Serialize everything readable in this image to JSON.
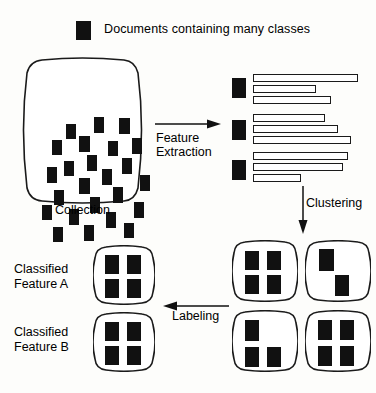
{
  "diagram": {
    "title_text": "Document clustering and classification pipeline",
    "legend": {
      "swatch_name": "document-swatch",
      "label": "Documents containing many classes",
      "swatch_color": "#111111"
    },
    "collection": {
      "caption": "Collection",
      "document_count": 24,
      "documents": [
        {
          "x": 48,
          "y": 67,
          "w": 10,
          "h": 15
        },
        {
          "x": 76,
          "y": 60,
          "w": 10,
          "h": 16
        },
        {
          "x": 101,
          "y": 61,
          "w": 11,
          "h": 16
        },
        {
          "x": 34,
          "y": 83,
          "w": 10,
          "h": 15
        },
        {
          "x": 61,
          "y": 79,
          "w": 11,
          "h": 16
        },
        {
          "x": 90,
          "y": 84,
          "w": 10,
          "h": 15
        },
        {
          "x": 114,
          "y": 81,
          "w": 10,
          "h": 16
        },
        {
          "x": 69,
          "y": 98,
          "w": 10,
          "h": 16
        },
        {
          "x": 46,
          "y": 104,
          "w": 10,
          "h": 15
        },
        {
          "x": 29,
          "y": 110,
          "w": 10,
          "h": 16
        },
        {
          "x": 104,
          "y": 101,
          "w": 10,
          "h": 16
        },
        {
          "x": 84,
          "y": 112,
          "w": 10,
          "h": 16
        },
        {
          "x": 61,
          "y": 121,
          "w": 11,
          "h": 16
        },
        {
          "x": 122,
          "y": 118,
          "w": 10,
          "h": 16
        },
        {
          "x": 36,
          "y": 133,
          "w": 10,
          "h": 15
        },
        {
          "x": 95,
          "y": 130,
          "w": 10,
          "h": 16
        },
        {
          "x": 72,
          "y": 140,
          "w": 10,
          "h": 16
        },
        {
          "x": 24,
          "y": 148,
          "w": 10,
          "h": 15
        },
        {
          "x": 51,
          "y": 152,
          "w": 10,
          "h": 16
        },
        {
          "x": 116,
          "y": 145,
          "w": 10,
          "h": 16
        },
        {
          "x": 88,
          "y": 155,
          "w": 10,
          "h": 16
        },
        {
          "x": 35,
          "y": 170,
          "w": 10,
          "h": 15
        },
        {
          "x": 66,
          "y": 168,
          "w": 10,
          "h": 16
        },
        {
          "x": 106,
          "y": 166,
          "w": 10,
          "h": 15
        }
      ]
    },
    "arrows": {
      "feature_extraction": {
        "label_line1": "Feature",
        "label_line2": "Extraction",
        "direction": "right"
      },
      "clustering": {
        "label": "Clustering",
        "direction": "down"
      },
      "labeling": {
        "label": "Labeling",
        "direction": "left"
      }
    },
    "feature_bars": {
      "groups": [
        {
          "doc_y": 78,
          "bars": [
            {
              "y": 74,
              "w": 105
            },
            {
              "y": 85,
              "w": 63
            },
            {
              "y": 96,
              "w": 78
            }
          ]
        },
        {
          "doc_y": 120,
          "bars": [
            {
              "y": 114,
              "w": 72
            },
            {
              "y": 125,
              "w": 85
            },
            {
              "y": 136,
              "w": 98
            }
          ]
        },
        {
          "doc_y": 160,
          "bars": [
            {
              "y": 152,
              "w": 95
            },
            {
              "y": 163,
              "w": 90
            },
            {
              "y": 174,
              "w": 48
            }
          ]
        }
      ]
    },
    "clusters": [
      {
        "name": "cluster-top-left",
        "x": 232,
        "y": 240,
        "w": 66,
        "h": 62,
        "docs": [
          {
            "x": 13,
            "y": 11,
            "w": 14,
            "h": 19
          },
          {
            "x": 35,
            "y": 11,
            "w": 14,
            "h": 19
          },
          {
            "x": 13,
            "y": 35,
            "w": 14,
            "h": 19
          },
          {
            "x": 35,
            "y": 35,
            "w": 14,
            "h": 19
          }
        ]
      },
      {
        "name": "cluster-top-right",
        "x": 305,
        "y": 240,
        "w": 66,
        "h": 62,
        "docs": [
          {
            "x": 14,
            "y": 9,
            "w": 15,
            "h": 22
          },
          {
            "x": 30,
            "y": 35,
            "w": 14,
            "h": 21
          }
        ]
      },
      {
        "name": "cluster-bottom-left",
        "x": 232,
        "y": 310,
        "w": 66,
        "h": 62,
        "docs": [
          {
            "x": 13,
            "y": 10,
            "w": 14,
            "h": 21
          },
          {
            "x": 13,
            "y": 37,
            "w": 14,
            "h": 20
          },
          {
            "x": 35,
            "y": 37,
            "w": 14,
            "h": 20
          }
        ]
      },
      {
        "name": "cluster-bottom-right",
        "x": 305,
        "y": 310,
        "w": 66,
        "h": 62,
        "docs": [
          {
            "x": 13,
            "y": 10,
            "w": 14,
            "h": 20
          },
          {
            "x": 35,
            "y": 10,
            "w": 14,
            "h": 20
          },
          {
            "x": 13,
            "y": 36,
            "w": 14,
            "h": 20
          },
          {
            "x": 35,
            "y": 36,
            "w": 14,
            "h": 20
          }
        ]
      }
    ],
    "classified": [
      {
        "name": "classified-feature-a",
        "label_line1": "Classified",
        "label_line2": "Feature A",
        "x": 93,
        "y": 245,
        "w": 62,
        "h": 60,
        "docs": [
          {
            "x": 12,
            "y": 10,
            "w": 14,
            "h": 19
          },
          {
            "x": 34,
            "y": 10,
            "w": 14,
            "h": 19
          },
          {
            "x": 12,
            "y": 34,
            "w": 14,
            "h": 19
          },
          {
            "x": 34,
            "y": 34,
            "w": 14,
            "h": 19
          }
        ]
      },
      {
        "name": "classified-feature-b",
        "label_line1": "Classified",
        "label_line2": "Feature B",
        "x": 93,
        "y": 312,
        "w": 62,
        "h": 60,
        "docs": [
          {
            "x": 12,
            "y": 10,
            "w": 14,
            "h": 19
          },
          {
            "x": 34,
            "y": 10,
            "w": 14,
            "h": 19
          },
          {
            "x": 12,
            "y": 34,
            "w": 14,
            "h": 19
          },
          {
            "x": 34,
            "y": 34,
            "w": 14,
            "h": 19
          }
        ]
      }
    ],
    "colors": {
      "document_fill": "#111111",
      "stroke": "#1a1a1a",
      "background": "#fdfdfb"
    }
  }
}
